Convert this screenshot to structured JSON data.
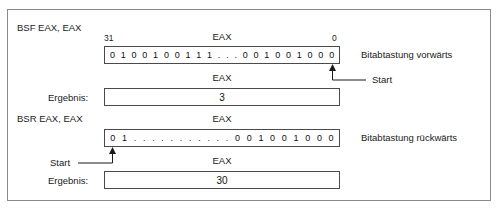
{
  "figure": {
    "title_note": "BSF / BSR Bitabtastung",
    "sections": [
      {
        "operation": "BSF EAX, EAX",
        "bit_index_high": "31",
        "bit_index_low": "0",
        "register_label": "EAX",
        "bits": [
          "0",
          "1",
          "0",
          "0",
          "1",
          "0",
          "0",
          "1",
          "1",
          "1",
          ".",
          ".",
          ".",
          "0",
          "0",
          "1",
          "0",
          "0",
          "1",
          "0",
          "0",
          "0"
        ],
        "scan_label": "Bitabtastung vorwärts",
        "start_label": "Start",
        "result_label": "Ergebnis:",
        "result_register_label": "EAX",
        "result_value": "3"
      },
      {
        "operation": "BSR EAX, EAX",
        "register_label": "EAX",
        "bits": [
          "0",
          "1",
          ".",
          ".",
          ".",
          ".",
          ".",
          ".",
          ".",
          ".",
          ".",
          ".",
          ".",
          "0",
          "0",
          "1",
          "0",
          "0",
          "1",
          "0",
          "0",
          "0"
        ],
        "scan_label": "Bitabtastung rückwärts",
        "start_label": "Start",
        "result_label": "Ergebnis:",
        "result_register_label": "EAX",
        "result_value": "30"
      }
    ],
    "colors": {
      "frame_border": "#8a8a8a",
      "box_border": "#4a4a4a",
      "text": "#1a1a1a",
      "background": "#ffffff"
    }
  }
}
